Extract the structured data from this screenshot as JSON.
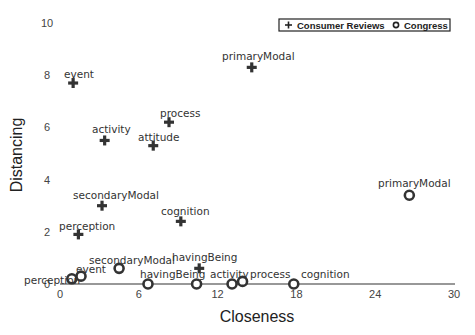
{
  "chart_data": {
    "type": "scatter",
    "title": "",
    "xlabel": "Closeness",
    "ylabel": "Distancing",
    "xlim": [
      0,
      30
    ],
    "ylim": [
      0,
      10
    ],
    "xticks": [
      0,
      6,
      12,
      18,
      24,
      30
    ],
    "yticks": [
      0,
      2,
      4,
      6,
      8,
      10
    ],
    "grid": false,
    "legend_position": "top-right",
    "series": [
      {
        "name": "Consumer Reviews",
        "marker": "plus",
        "points": [
          {
            "label": "event",
            "x": 1.0,
            "y": 7.7
          },
          {
            "label": "activity",
            "x": 3.4,
            "y": 5.5
          },
          {
            "label": "attitude",
            "x": 7.1,
            "y": 5.3
          },
          {
            "label": "process",
            "x": 8.3,
            "y": 6.2
          },
          {
            "label": "primaryModal",
            "x": 14.6,
            "y": 8.3
          },
          {
            "label": "secondaryModal",
            "x": 3.2,
            "y": 3.0
          },
          {
            "label": "cognition",
            "x": 9.2,
            "y": 2.4
          },
          {
            "label": "perception",
            "x": 1.4,
            "y": 1.9
          },
          {
            "label": "havingBeing",
            "x": 10.6,
            "y": 0.6
          }
        ]
      },
      {
        "name": "Congress",
        "marker": "circle",
        "points": [
          {
            "label": "perception",
            "x": 0.9,
            "y": 0.2
          },
          {
            "label": "event",
            "x": 1.6,
            "y": 0.3
          },
          {
            "label": "secondaryModal",
            "x": 4.5,
            "y": 0.6
          },
          {
            "label": "",
            "x": 6.7,
            "y": 0.0
          },
          {
            "label": "havingBeing",
            "x": 10.4,
            "y": 0.0
          },
          {
            "label": "activity",
            "x": 13.1,
            "y": 0.0
          },
          {
            "label": "process",
            "x": 13.9,
            "y": 0.1
          },
          {
            "label": "cognition",
            "x": 17.8,
            "y": 0.0
          },
          {
            "label": "primaryModal",
            "x": 26.6,
            "y": 3.4
          }
        ]
      }
    ]
  },
  "legend": {
    "items": [
      {
        "symbol": "+",
        "label": "Consumer Reviews"
      },
      {
        "symbol": "o",
        "label": "Congress"
      }
    ]
  },
  "colors": {
    "marker": "#333333",
    "axis": "#333333",
    "text": "#333333"
  }
}
